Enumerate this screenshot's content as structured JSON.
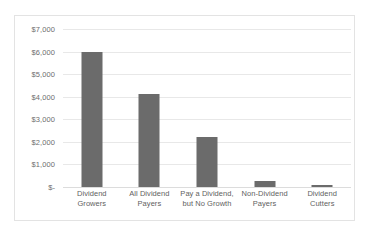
{
  "chart_data": {
    "type": "bar",
    "title": "",
    "subtitle": "",
    "xlabel": "",
    "ylabel": "",
    "categories": [
      "Dividend Growers",
      "All Dividend Payers",
      "Pay a Dividend, but No Growth",
      "Non-Dividend Payers",
      "Dividend Cutters"
    ],
    "values": [
      6000,
      4100,
      2200,
      280,
      90
    ],
    "ylim": [
      0,
      7000
    ],
    "ytick_values": [
      7000,
      6000,
      5000,
      4000,
      3000,
      2000,
      1000,
      0
    ],
    "ytick_labels": [
      "$7,000",
      "$6,000",
      "$5,000",
      "$4,000",
      "$3,000",
      "$2,000",
      "$1,000",
      "$-"
    ],
    "grid": true,
    "legend": false,
    "legend_position": "none",
    "bar_color": "#6b6b6b",
    "gridline_color": "#e8e8e8",
    "plot_background": "#ffffff",
    "border_color": "#e3e3e3"
  },
  "axis": {
    "x_labels_wrapped": [
      [
        "Dividend",
        "Growers"
      ],
      [
        "All Dividend",
        "Payers"
      ],
      [
        "Pay a Dividend,",
        "but No Growth"
      ],
      [
        "Non-Dividend",
        "Payers"
      ],
      [
        "Dividend",
        "Cutters"
      ]
    ]
  }
}
